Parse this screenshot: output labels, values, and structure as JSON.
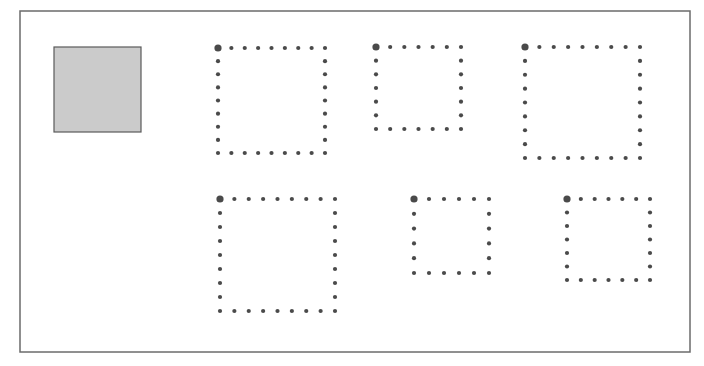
{
  "canvas": {
    "width": 704,
    "height": 366,
    "background": "#ffffff"
  },
  "frame": {
    "x": 20,
    "y": 11,
    "width": 670,
    "height": 341,
    "stroke": "#6b6b6b",
    "stroke_width": 1.5
  },
  "reference_square": {
    "x": 54,
    "y": 47,
    "width": 87,
    "height": 85,
    "fill": "#cbcbcb",
    "stroke": "#5a5a5a",
    "stroke_width": 1.2
  },
  "dot_style": {
    "color": "#4a4a4a",
    "dot_radius": 2.1,
    "corner_radius": 3.6
  },
  "dotted_squares": [
    {
      "id": 1,
      "x1": 218,
      "y1": 48,
      "x2": 325,
      "y2": 153,
      "dots_per_side": 9
    },
    {
      "id": 2,
      "x1": 376,
      "y1": 47,
      "x2": 461,
      "y2": 129,
      "dots_per_side": 7
    },
    {
      "id": 3,
      "x1": 525,
      "y1": 47,
      "x2": 640,
      "y2": 158,
      "dots_per_side": 9
    },
    {
      "id": 4,
      "x1": 220,
      "y1": 199,
      "x2": 335,
      "y2": 311,
      "dots_per_side": 9
    },
    {
      "id": 5,
      "x1": 414,
      "y1": 199,
      "x2": 489,
      "y2": 273,
      "dots_per_side": 6
    },
    {
      "id": 6,
      "x1": 567,
      "y1": 199,
      "x2": 650,
      "y2": 280,
      "dots_per_side": 7
    }
  ]
}
